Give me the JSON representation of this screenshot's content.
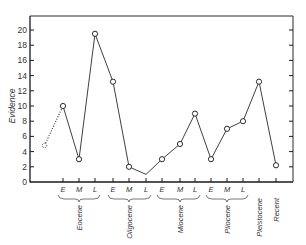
{
  "chart_data": {
    "type": "line",
    "title": "",
    "xlabel": "",
    "ylabel": "Evidence",
    "ylim": [
      0,
      20
    ],
    "yticks": [
      0,
      2,
      4,
      6,
      8,
      10,
      12,
      14,
      16,
      18,
      20
    ],
    "grid": false,
    "legend": null,
    "categories": [
      "Eocene E",
      "Eocene M",
      "Eocene L",
      "Oligocene E",
      "Oligocene M",
      "Oligocene L",
      "Miocene E",
      "Miocene M",
      "Miocene L",
      "Pliocene E",
      "Pliocene M",
      "Pliocene L",
      "Pleistocene",
      "Recent"
    ],
    "x_tick_labels": [
      "E",
      "M",
      "L",
      "E",
      "M",
      "L",
      "E",
      "M",
      "L",
      "E",
      "M",
      "L",
      "",
      ""
    ],
    "epoch_groups": [
      {
        "name": "Eocene",
        "span": [
          0,
          2
        ]
      },
      {
        "name": "Oligocene",
        "span": [
          3,
          5
        ]
      },
      {
        "name": "Miocene",
        "span": [
          6,
          8
        ]
      },
      {
        "name": "Pliocene",
        "span": [
          9,
          11
        ]
      },
      {
        "name": "Pleistocene",
        "span": [
          12,
          12
        ]
      },
      {
        "name": "Recent",
        "span": [
          13,
          13
        ]
      }
    ],
    "series": [
      {
        "name": "Evidence",
        "values": [
          10,
          3,
          19.5,
          13.2,
          2,
          1,
          3,
          5,
          9,
          3,
          7,
          8,
          13.2,
          2.2
        ],
        "markers": [
          true,
          true,
          true,
          true,
          true,
          false,
          true,
          true,
          true,
          true,
          true,
          true,
          true,
          true
        ]
      }
    ],
    "extrapolated_segment": {
      "style": "dotted",
      "from": {
        "position": "before Eocene E",
        "value": 4.8
      },
      "to": {
        "category": "Eocene E",
        "value": 10
      }
    }
  },
  "axis": {
    "y_label": "Evidence",
    "y_tick_labels": [
      "0",
      "2",
      "4",
      "6",
      "8",
      "10",
      "12",
      "14",
      "16",
      "18",
      "20"
    ]
  },
  "labels": {
    "sub": [
      "E",
      "M",
      "L",
      "E",
      "M",
      "L",
      "E",
      "M",
      "L",
      "E",
      "M",
      "L"
    ],
    "epochs": [
      "Eocene",
      "Oligocene",
      "Miocene",
      "Pliocene",
      "Pleistocene",
      "Recent"
    ]
  }
}
